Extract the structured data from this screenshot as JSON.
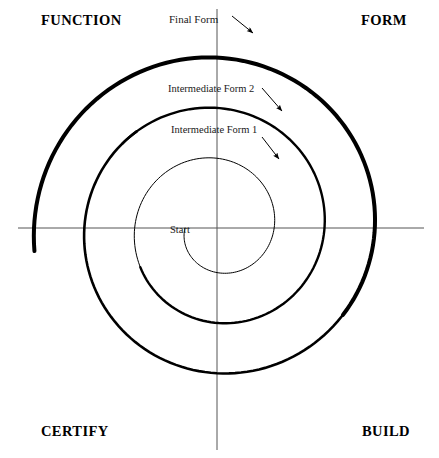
{
  "diagram": {
    "type": "spiral-development-model",
    "canvas": {
      "width": 439,
      "height": 458
    },
    "center": {
      "x": 217,
      "y": 228
    },
    "colors": {
      "stroke": "#000000",
      "axis": "#555555",
      "background": "#ffffff",
      "text": "#000000"
    },
    "axes": {
      "horizontal": {
        "x1": 18,
        "y1": 228,
        "x2": 424,
        "y2": 228,
        "width": 1
      },
      "vertical": {
        "x1": 217,
        "y1": 9,
        "x2": 217,
        "y2": 450,
        "width": 1
      }
    },
    "quadrant_labels": [
      {
        "name": "function",
        "text": "FUNCTION",
        "position": "top-left"
      },
      {
        "name": "form",
        "text": "FORM",
        "position": "top-right"
      },
      {
        "name": "certify",
        "text": "CERTIFY",
        "position": "bottom-left"
      },
      {
        "name": "build",
        "text": "BUILD",
        "position": "bottom-right"
      }
    ],
    "callouts": [
      {
        "name": "final-form",
        "text": "Final Form",
        "arrow": {
          "x1": 232,
          "y1": 16,
          "x2": 253,
          "y2": 33
        }
      },
      {
        "name": "intermediate-form-2",
        "text": "Intermediate Form 2",
        "arrow": {
          "x1": 262,
          "y1": 88,
          "x2": 282,
          "y2": 111
        }
      },
      {
        "name": "intermediate-form-1",
        "text": "Intermediate Form 1",
        "arrow": {
          "x1": 262,
          "y1": 137,
          "x2": 279,
          "y2": 159
        }
      },
      {
        "name": "start",
        "text": "Start",
        "arrow": null
      }
    ],
    "spiral": {
      "description": "Continuous clockwise outward spiral from Start at center to Final Form at outer edge",
      "start_angle_deg": 180,
      "turns": 3.02,
      "r_start": 32,
      "r_end": 184,
      "growth": "linear",
      "ellipse_ratio": 1.0,
      "thin_width": 1.0,
      "segments": [
        {
          "name": "start-turn",
          "t_from": 0.0,
          "t_to": 0.36,
          "width": 1.0
        },
        {
          "name": "intermediate-form-1",
          "t_from": 0.36,
          "t_to": 0.62,
          "width": 2.4
        },
        {
          "name": "intermediate-form-2",
          "t_from": 0.62,
          "t_to": 0.8,
          "width": 2.6
        },
        {
          "name": "final-form",
          "t_from": 0.8,
          "t_to": 1.0,
          "width": 4.0
        }
      ]
    },
    "horizontal_axis_crossings_px": [
      33,
      95,
      130,
      163,
      185,
      255,
      282,
      302,
      340,
      392,
      400
    ]
  }
}
